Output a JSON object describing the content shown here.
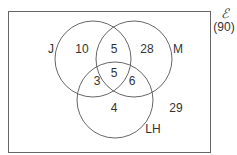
{
  "universe": {
    "symbol": "ℰ",
    "total": "(90)"
  },
  "sets": [
    {
      "label": "J"
    },
    {
      "label": "M"
    },
    {
      "label": "LH"
    }
  ],
  "regions": {
    "j_only": "10",
    "j_m_only": "5",
    "m_only": "28",
    "j_lh_only": "3",
    "all_three": "5",
    "m_lh_only": "6",
    "lh_only": "4",
    "outside": "29"
  },
  "colors": {
    "stroke": "#555555",
    "text": "#333333"
  }
}
